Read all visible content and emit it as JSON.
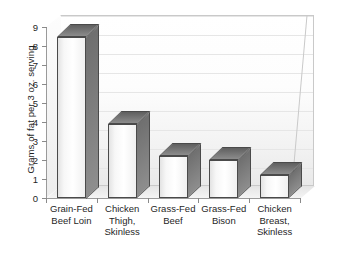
{
  "chart_data": {
    "type": "bar",
    "title": "",
    "xlabel": "",
    "ylabel": "Grams of fat per 3 oz. serving",
    "ylim": [
      0,
      9
    ],
    "ytick_labels": [
      "0",
      "1",
      "2",
      "3",
      "4",
      "5",
      "6",
      "7",
      "8",
      "9"
    ],
    "ytick_values": [
      0,
      1,
      2,
      3,
      4,
      5,
      6,
      7,
      8,
      9
    ],
    "grid": true,
    "legend": null,
    "categories": [
      "Grain-Fed Beef Loin",
      "Chicken Thigh, Skinless",
      "Grass-Fed Beef",
      "Grass-Fed Bison",
      "Chicken Breast, Skinless"
    ],
    "category_lines": [
      [
        "Grain-Fed",
        "Beef Loin"
      ],
      [
        "Chicken",
        "Thigh,",
        "Skinless"
      ],
      [
        "Grass-Fed",
        "Beef"
      ],
      [
        "Grass-Fed",
        "Bison"
      ],
      [
        "Chicken",
        "Breast,",
        "Skinless"
      ]
    ],
    "values": [
      8.5,
      3.9,
      2.2,
      2.0,
      1.2
    ],
    "style": "3d-column",
    "colors": {
      "bar_face": "#ffffff",
      "bar_side": "#7d7d7d",
      "bar_top": "#6f6f6f",
      "bar_outline": "#4a4a4a",
      "plot_background": "#f6f6f6",
      "axis": "#9a9a9a",
      "gridline": "#e6e6e6",
      "text": "#1f1f1f"
    }
  }
}
